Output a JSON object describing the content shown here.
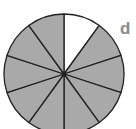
{
  "figure": {
    "type": "fraction-circle",
    "total_slices": 10,
    "shaded_slices": 9,
    "unshaded_slices": 1,
    "unshaded_slice_index": 0,
    "shaded_color": "#a9a9a9",
    "unshaded_color": "#ffffff",
    "stroke_color": "#222222",
    "label": "d",
    "label_color": "#8a8a8a"
  }
}
